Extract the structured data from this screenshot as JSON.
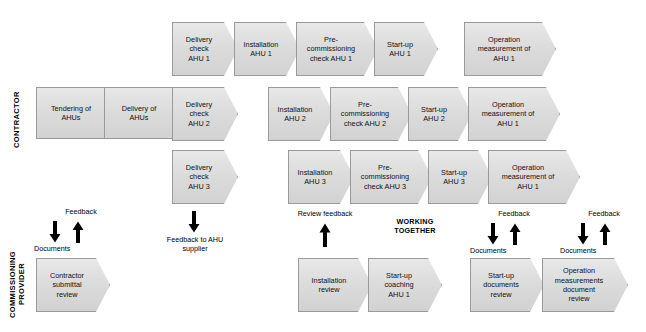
{
  "diagram": {
    "background_color": "#ffffff",
    "shape_fill": "#dcdcdc",
    "shape_border": "#9a9a9a",
    "text_color": "#111111"
  },
  "lanes": [
    {
      "id": "contractor",
      "label": "CONTRACTOR"
    },
    {
      "id": "commissioning_provider",
      "label": "COMMISSIONING\nPROVIDER"
    }
  ],
  "contractor": {
    "shared": [
      {
        "label": "Tendering of\nAHUs"
      },
      {
        "label": "Delivery of\nAHUs"
      }
    ],
    "row1": [
      {
        "label": "Delivery\ncheck\nAHU 1"
      },
      {
        "label": "Installation\nAHU 1"
      },
      {
        "label": "Pre-\ncommissioning\ncheck AHU 1"
      },
      {
        "label": "Start-up\nAHU 1"
      },
      {
        "label": "Operation\nmeasurement of\nAHU 1"
      }
    ],
    "row2": [
      {
        "label": "Delivery\ncheck\nAHU 2"
      },
      {
        "label": "Installation\nAHU 2"
      },
      {
        "label": "Pre-\ncommissioning\ncheck AHU 2"
      },
      {
        "label": "Start-up\nAHU 2"
      },
      {
        "label": "Operation\nmeasurement of\nAHU 1"
      }
    ],
    "row3": [
      {
        "label": "Delivery\ncheck\nAHU 3"
      },
      {
        "label": "Installation\nAHU 3"
      },
      {
        "label": "Pre-\ncommissioning\ncheck AHU 3"
      },
      {
        "label": "Start-up\nAHU 3"
      },
      {
        "label": "Operation\nmeasurement of\nAHU 1"
      }
    ]
  },
  "provider": {
    "steps": [
      {
        "label": "Contractor\nsubmittal\nreview"
      },
      {
        "label": "Installation\nreview"
      },
      {
        "label": "Start-up\ncoaching\nAHU 1"
      },
      {
        "label": "Start-up\ndocuments\nreview"
      },
      {
        "label": "Operation\nmeasurements\ndocument\nreview"
      }
    ]
  },
  "annotations": {
    "feedback_1": "Feedback",
    "documents_1": "Documents",
    "feedback_to_ahu_supplier": "Feedback to AHU\nsupplier",
    "review_feedback": "Review feedback",
    "working_together": "WORKING\nTOGETHER",
    "documents_2": "Documents",
    "feedback_2": "Feedback",
    "documents_3": "Documents",
    "feedback_3": "Feedback"
  }
}
